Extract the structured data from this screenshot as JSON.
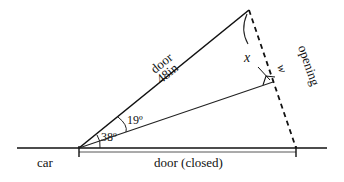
{
  "diagram": {
    "type": "geometry",
    "labels": {
      "door": "door",
      "door_length": "48in",
      "opening": "opening",
      "angle_x": "x",
      "side_w": "w",
      "angle_19": "19º",
      "angle_38": "38º",
      "car": "car",
      "door_closed": "door (closed)"
    },
    "values": {
      "door_length_in": 48,
      "angle_total_deg": 38,
      "angle_half_deg": 19
    },
    "colors": {
      "line": "#111111",
      "background": "#ffffff"
    }
  }
}
